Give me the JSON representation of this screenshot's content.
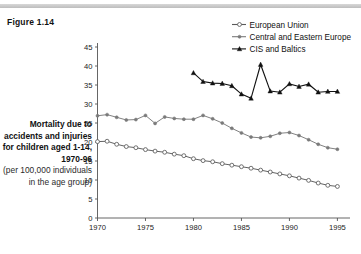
{
  "figure": {
    "number_label": "Figure 1.14",
    "caption_bold": "Mortality due to accidents and injuries for children aged 1-14, 1970-96",
    "caption_sub": "(per 100,000 individuals in the age group)"
  },
  "colors": {
    "european_union": "#5a5a5a",
    "central_eastern_europe": "#7a7a7a",
    "cis_baltics": "#111111",
    "axis": "#555555",
    "background": "#ffffff",
    "rule": "#c8c8c8"
  },
  "legend": {
    "position": "top-right",
    "entries": [
      {
        "label": "European Union",
        "marker": "open-circle"
      },
      {
        "label": "Central and Eastern Europe",
        "marker": "small-dot"
      },
      {
        "label": "CIS and Baltics",
        "marker": "filled-triangle"
      }
    ]
  },
  "chart_data": {
    "type": "line",
    "title": "",
    "subtitle": "",
    "xlabel": "",
    "ylabel": "",
    "xlim": [
      1970,
      1996
    ],
    "ylim": [
      0,
      45
    ],
    "xticks": [
      1970,
      1975,
      1980,
      1985,
      1990,
      1995
    ],
    "yticks": [
      0,
      5,
      10,
      15,
      20,
      25,
      30,
      35,
      40,
      45
    ],
    "grid": false,
    "legend_position": "top-right",
    "series": [
      {
        "name": "European Union",
        "marker": "open-circle",
        "color": "#5a5a5a",
        "x": [
          1970,
          1971,
          1972,
          1973,
          1974,
          1975,
          1976,
          1977,
          1978,
          1979,
          1980,
          1981,
          1982,
          1983,
          1984,
          1985,
          1986,
          1987,
          1988,
          1989,
          1990,
          1991,
          1992,
          1993,
          1994,
          1995
        ],
        "values": [
          20.1,
          20.2,
          19.4,
          18.8,
          18.5,
          18.0,
          17.6,
          17.3,
          16.8,
          16.4,
          15.6,
          15.1,
          14.8,
          14.3,
          13.9,
          13.5,
          13.1,
          12.6,
          12.1,
          11.6,
          11.1,
          10.5,
          9.9,
          9.2,
          8.6,
          8.3
        ]
      },
      {
        "name": "Central and Eastern Europe",
        "marker": "small-dot",
        "color": "#7a7a7a",
        "x": [
          1970,
          1971,
          1972,
          1973,
          1974,
          1975,
          1976,
          1977,
          1978,
          1979,
          1980,
          1981,
          1982,
          1983,
          1984,
          1985,
          1986,
          1987,
          1988,
          1989,
          1990,
          1991,
          1992,
          1993,
          1994,
          1995
        ],
        "values": [
          26.9,
          27.2,
          26.5,
          25.8,
          25.9,
          27.0,
          24.9,
          26.6,
          26.2,
          26.0,
          26.0,
          27.0,
          26.1,
          25.0,
          23.6,
          22.4,
          21.3,
          21.1,
          21.5,
          22.3,
          22.5,
          21.7,
          20.6,
          19.4,
          18.5,
          18.1
        ]
      },
      {
        "name": "CIS and Baltics",
        "marker": "filled-triangle",
        "color": "#111111",
        "x": [
          1980,
          1981,
          1982,
          1983,
          1984,
          1985,
          1986,
          1987,
          1988,
          1989,
          1990,
          1991,
          1992,
          1993,
          1994,
          1995
        ],
        "values": [
          38.2,
          35.9,
          35.5,
          35.4,
          34.8,
          32.6,
          31.5,
          40.4,
          33.4,
          33.1,
          35.3,
          34.6,
          35.2,
          33.1,
          33.3,
          33.3
        ]
      }
    ]
  }
}
